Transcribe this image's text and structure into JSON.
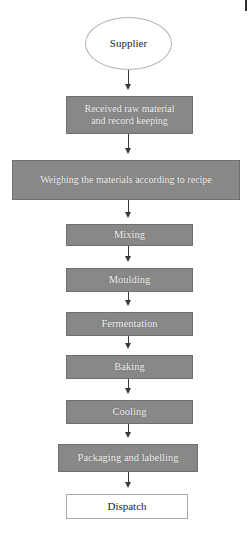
{
  "diagram": {
    "colors": {
      "process_fill": "#888888",
      "process_border": "#6f6f6f",
      "process_text": "#f2f2f2",
      "terminator_fill": "#ffffff",
      "terminator_text": "#1d1d1d",
      "connector": "#3a3a3a",
      "background": "#ffffff"
    },
    "nodes": [
      {
        "id": "supplier",
        "label": "Supplier",
        "shape": "ellipse",
        "style": "terminator-start",
        "x": 85,
        "y": 17,
        "width": 87,
        "height": 53,
        "font_size": 11
      },
      {
        "id": "received-raw-material",
        "label": "Received raw material\nand record keeping",
        "shape": "rectangle",
        "style": "process",
        "x": 66,
        "y": 96,
        "width": 127,
        "height": 38,
        "font_size": 10
      },
      {
        "id": "weighing-materials",
        "label": "Weighing the materials according to recipe",
        "shape": "rectangle",
        "style": "process",
        "x": 12,
        "y": 160,
        "width": 228,
        "height": 40,
        "font_size": 10
      },
      {
        "id": "mixing",
        "label": "Mixing",
        "shape": "rectangle",
        "style": "process",
        "x": 66,
        "y": 224,
        "width": 127,
        "height": 22,
        "font_size": 10.5
      },
      {
        "id": "moulding",
        "label": "Moulding",
        "shape": "rectangle",
        "style": "process",
        "x": 66,
        "y": 268,
        "width": 127,
        "height": 24,
        "font_size": 10.5
      },
      {
        "id": "fermentation",
        "label": "Fermentation",
        "shape": "rectangle",
        "style": "process",
        "x": 66,
        "y": 312,
        "width": 127,
        "height": 24,
        "font_size": 10.5
      },
      {
        "id": "baking",
        "label": "Baking",
        "shape": "rectangle",
        "style": "process",
        "x": 66,
        "y": 355,
        "width": 127,
        "height": 24,
        "font_size": 10.5
      },
      {
        "id": "cooling",
        "label": "Cooling",
        "shape": "rectangle",
        "style": "process",
        "x": 66,
        "y": 400,
        "width": 127,
        "height": 24,
        "font_size": 10.5
      },
      {
        "id": "packaging-and-labelling",
        "label": "Packaging and labelling",
        "shape": "rectangle",
        "style": "process",
        "x": 58,
        "y": 444,
        "width": 140,
        "height": 28,
        "font_size": 10.5
      },
      {
        "id": "dispatch",
        "label": "Dispatch",
        "shape": "rectangle",
        "style": "terminator-end",
        "x": 66,
        "y": 494,
        "width": 122,
        "height": 25,
        "font_size": 11
      }
    ],
    "connectors": [
      {
        "id": "supplier-to-received",
        "from": "supplier",
        "to": "received-raw-material",
        "x": 128,
        "y": 70,
        "length": 20
      },
      {
        "id": "received-to-weighing",
        "from": "received-raw-material",
        "to": "weighing-materials",
        "x": 128,
        "y": 134,
        "length": 20
      },
      {
        "id": "weighing-to-mixing",
        "from": "weighing-materials",
        "to": "mixing",
        "x": 128,
        "y": 200,
        "length": 18
      },
      {
        "id": "mixing-to-moulding",
        "from": "mixing",
        "to": "moulding",
        "x": 128,
        "y": 246,
        "length": 16
      },
      {
        "id": "moulding-to-fermentation",
        "from": "moulding",
        "to": "fermentation",
        "x": 128,
        "y": 292,
        "length": 14
      },
      {
        "id": "fermentation-to-baking",
        "from": "fermentation",
        "to": "baking",
        "x": 128,
        "y": 336,
        "length": 13
      },
      {
        "id": "baking-to-cooling",
        "from": "baking",
        "to": "cooling",
        "x": 128,
        "y": 379,
        "length": 15
      },
      {
        "id": "cooling-to-packaging",
        "from": "cooling",
        "to": "packaging-and-labelling",
        "x": 128,
        "y": 424,
        "length": 14
      },
      {
        "id": "packaging-to-dispatch",
        "from": "packaging-and-labelling",
        "to": "dispatch",
        "x": 128,
        "y": 472,
        "length": 16
      }
    ],
    "page_edge_mark": {
      "x": 245,
      "y": 0,
      "width": 2,
      "height": 11
    }
  }
}
